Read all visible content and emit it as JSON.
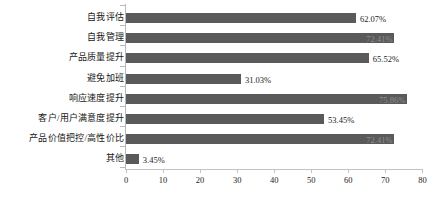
{
  "chart_data": {
    "type": "bar",
    "orientation": "horizontal",
    "title": "",
    "xlabel": "",
    "ylabel": "",
    "xlim": [
      0,
      80
    ],
    "xticks": [
      0,
      10,
      20,
      30,
      40,
      50,
      60,
      70,
      80
    ],
    "xtick_labels": [
      "0",
      "10",
      "20",
      "30",
      "40",
      "50",
      "60",
      "70",
      "80"
    ],
    "grid": false,
    "legend": false,
    "bar_color": "#5a5a5a",
    "categories": [
      "自我评估",
      "自我管理",
      "产品质量提升",
      "避免加班",
      "响应速度提升",
      "客户/用户满意度提升",
      "产品价值把控/高性价比",
      "其他"
    ],
    "values": [
      62.07,
      72.41,
      65.52,
      31.03,
      75.86,
      53.45,
      72.41,
      3.45
    ],
    "data_labels": [
      "62.07%",
      "72.41%",
      "65.52%",
      "31.03%",
      "75.86%",
      "53.45%",
      "72.41%",
      "3.45%"
    ],
    "label_placement": [
      "outside",
      "inside",
      "outside",
      "outside",
      "inside",
      "outside",
      "inside",
      "outside"
    ]
  }
}
